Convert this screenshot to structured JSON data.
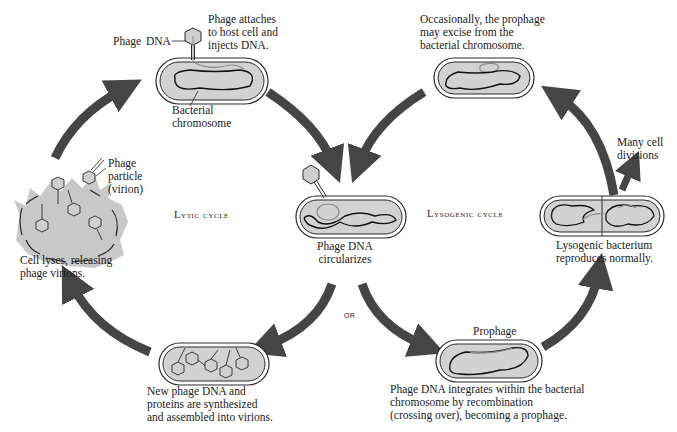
{
  "diagram": {
    "colors": {
      "arrow": "#454545",
      "cell_fill": "#d2d2d2",
      "cell_outline": "#2a2a2a",
      "chromosome": "#111111",
      "phage_dna": "#8a8a8a",
      "lysis_splash": "#c8c8c8"
    },
    "cycle_labels": {
      "lytic": "Lytic cycle",
      "lysogenic": "Lysogenic cycle",
      "or": "OR"
    },
    "stages": {
      "attach": {
        "label_phage": "Phage",
        "label_dna": "DNA",
        "caption": [
          "Phage attaches",
          "to host cell and",
          "injects DNA."
        ],
        "chromosome_label": [
          "Bacterial",
          "chromosome"
        ]
      },
      "circularize": {
        "caption": [
          "Phage DNA",
          "circularizes"
        ]
      },
      "synthesize": {
        "caption": [
          "New phage DNA and",
          "proteins are synthesized",
          "and assembled into virions."
        ]
      },
      "lyse": {
        "particle_label": [
          "Phage",
          "particle",
          "(virion)"
        ],
        "caption": [
          "Cell lyses, releasing",
          "phage virions."
        ]
      },
      "integrate": {
        "title": "Prophage",
        "caption": [
          "Phage DNA integrates within the bacterial",
          "chromosome by recombination",
          "(crossing over), becoming a prophage."
        ]
      },
      "reproduce": {
        "caption": [
          "Lysogenic bacterium",
          "reproduces normally."
        ],
        "divisions_label": [
          "Many cell",
          "divisions"
        ]
      },
      "excise": {
        "caption": [
          "Occasionally, the prophage",
          "may excise from the",
          "bacterial chromosome."
        ]
      }
    }
  }
}
